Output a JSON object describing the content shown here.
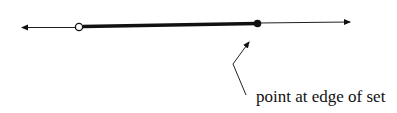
{
  "diagram": {
    "type": "number-line",
    "annotation": {
      "label": "point at edge of set"
    },
    "interval": {
      "left_endpoint": "open",
      "right_endpoint": "closed"
    },
    "colors": {
      "line": "#111111",
      "background": "#ffffff"
    }
  }
}
